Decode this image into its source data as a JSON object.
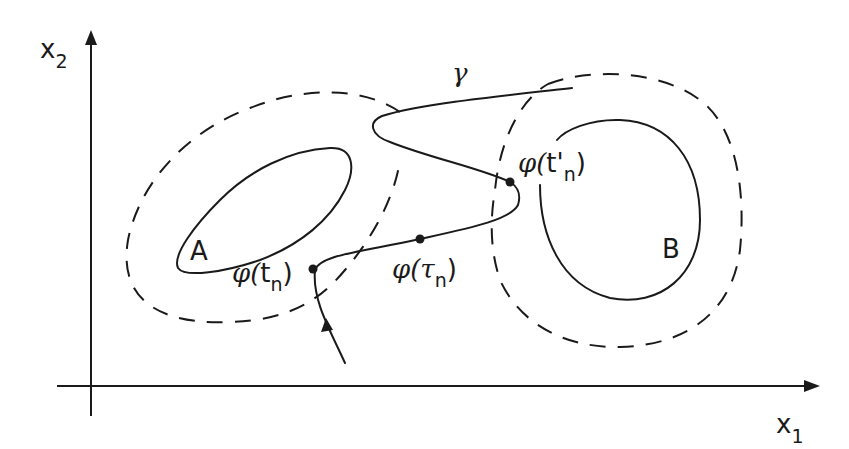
{
  "diagram": {
    "type": "phase-plane sketch",
    "axes": {
      "x_label": "x",
      "x_subscript": "1",
      "y_label": "x",
      "y_subscript": "2"
    },
    "sets": [
      {
        "id": "A",
        "label": "A",
        "boundary": "solid",
        "neighborhood": "dashed"
      },
      {
        "id": "B",
        "label": "B",
        "boundary": "solid",
        "neighborhood": "dashed"
      }
    ],
    "trajectory": {
      "label": "γ",
      "direction_arrow": true
    },
    "points": [
      {
        "id": "phi_tn",
        "func": "φ(",
        "arg": "t",
        "sub": "n",
        "close": ")"
      },
      {
        "id": "phi_taun",
        "func": "φ(",
        "arg": "τ",
        "sub": "n",
        "close": ")"
      },
      {
        "id": "phi_tn_prime",
        "func": "φ(",
        "arg": "t'",
        "sub": "n",
        "close": ")"
      }
    ],
    "colors": {
      "ink": "#1a1a1a",
      "background": "#ffffff"
    }
  }
}
